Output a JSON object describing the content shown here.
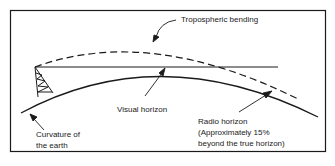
{
  "diagram": {
    "labels": {
      "tropospheric_bending": "Tropospheric bending",
      "visual_horizon": "Visual horizon",
      "curvature_line1": "Curvature of",
      "curvature_line2": "the earth",
      "radio_line1": "Radio horizon",
      "radio_line2": "(Approximately 15%",
      "radio_line3": "beyond the true horizon)"
    },
    "colors": {
      "line": "#1a1a1a",
      "background": "#ffffff"
    }
  }
}
